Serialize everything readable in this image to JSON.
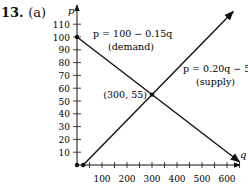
{
  "problem": {
    "number": "13.",
    "part": "(a)"
  },
  "chart_data": {
    "type": "line",
    "title": "",
    "xlabel": "q",
    "ylabel": "p",
    "xlim": [
      0,
      650
    ],
    "ylim": [
      0,
      115
    ],
    "x_ticks": [
      100,
      200,
      300,
      400,
      500,
      600
    ],
    "y_ticks": [
      10,
      20,
      30,
      40,
      50,
      60,
      70,
      80,
      90,
      100,
      110
    ],
    "grid": false,
    "series": [
      {
        "name": "demand",
        "equation": "p = 100 − 0.15q",
        "label_line1": "p = 100 − 0.15q",
        "label_line2": "(demand)",
        "points": [
          [
            0,
            100
          ],
          [
            650,
            2.5
          ]
        ]
      },
      {
        "name": "supply",
        "equation": "p = 0.20q − 5",
        "label_line1": "p = 0.20q − 5",
        "label_line2": "(supply)",
        "points": [
          [
            25,
            0
          ],
          [
            625,
            120
          ]
        ]
      }
    ],
    "annotations": [
      {
        "text": "(300, 55)",
        "x": 300,
        "y": 55
      }
    ],
    "marked_points": [
      [
        0,
        100
      ],
      [
        0,
        0
      ],
      [
        25,
        0
      ],
      [
        300,
        55
      ]
    ]
  }
}
